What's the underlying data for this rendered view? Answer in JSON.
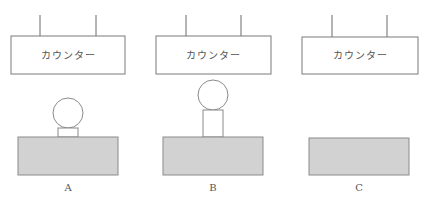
{
  "diagram": {
    "panels": [
      {
        "label": "A",
        "counter_text": "カウンター",
        "has_ball": true,
        "stand": "short"
      },
      {
        "label": "B",
        "counter_text": "カウンター",
        "has_ball": true,
        "stand": "tall"
      },
      {
        "label": "C",
        "counter_text": "カウンター",
        "has_ball": false,
        "stand": "none"
      }
    ],
    "colors": {
      "block_fill": "#d2d2d2",
      "outline": "#8a8a8a"
    }
  }
}
